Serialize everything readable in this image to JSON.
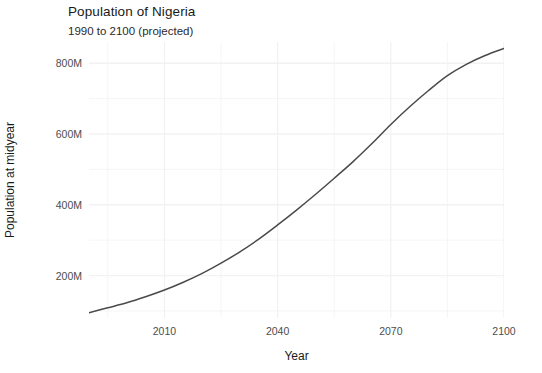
{
  "chart_data": {
    "type": "line",
    "title": "Population of Nigeria",
    "subtitle": "1990 to 2100 (projected)",
    "xlabel": "Year",
    "ylabel": "Population at midyear",
    "xlim": [
      1990,
      2100
    ],
    "ylim": [
      80000000,
      860000000
    ],
    "grid": true,
    "legend": "none",
    "line_color": "#4a4a4a",
    "background_color": "#ffffff",
    "gridline_color": "#f2f2f2",
    "x_ticks": [
      {
        "value": 2010,
        "label": "2010"
      },
      {
        "value": 2040,
        "label": "2040"
      },
      {
        "value": 2070,
        "label": "2070"
      },
      {
        "value": 2100,
        "label": "2100"
      }
    ],
    "x_minor_ticks": [
      1995,
      2025,
      2055,
      2085
    ],
    "y_ticks": [
      {
        "value": 200000000,
        "label": "200M"
      },
      {
        "value": 400000000,
        "label": "400M"
      },
      {
        "value": 600000000,
        "label": "600M"
      },
      {
        "value": 800000000,
        "label": "800M"
      }
    ],
    "y_minor_ticks": [
      100000000,
      300000000,
      500000000,
      700000000
    ],
    "series": [
      {
        "name": "Population at midyear",
        "x": [
          1990,
          1995,
          2000,
          2005,
          2010,
          2015,
          2020,
          2025,
          2030,
          2035,
          2040,
          2045,
          2050,
          2055,
          2060,
          2065,
          2070,
          2075,
          2080,
          2085,
          2090,
          2095,
          2100
        ],
        "values": [
          95000000,
          109000000,
          123000000,
          140000000,
          159000000,
          181000000,
          206000000,
          235000000,
          267000000,
          303000000,
          343000000,
          385000000,
          429000000,
          475000000,
          522000000,
          573000000,
          627000000,
          677000000,
          723000000,
          765000000,
          797000000,
          822000000,
          842000000
        ]
      }
    ]
  }
}
